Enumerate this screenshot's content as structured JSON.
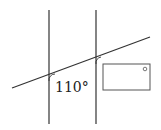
{
  "diagram": {
    "type": "parallel-lines-transversal",
    "angle_label": "110°",
    "colors": {
      "line": "#333333",
      "rect_stroke": "#555555",
      "background": "#ffffff"
    },
    "elements": {
      "left_vertical_line": {
        "x": 49,
        "y1": 10,
        "y2": 124
      },
      "right_vertical_line": {
        "x": 96,
        "y1": 10,
        "y2": 124
      },
      "transversal": {
        "x1": 12,
        "y1": 88,
        "x2": 150,
        "y2": 37
      },
      "rectangle": {
        "x": 103,
        "y": 64,
        "width": 47,
        "height": 26
      },
      "small_circle": {
        "cx": 145,
        "cy": 69,
        "r": 1.8
      }
    }
  }
}
